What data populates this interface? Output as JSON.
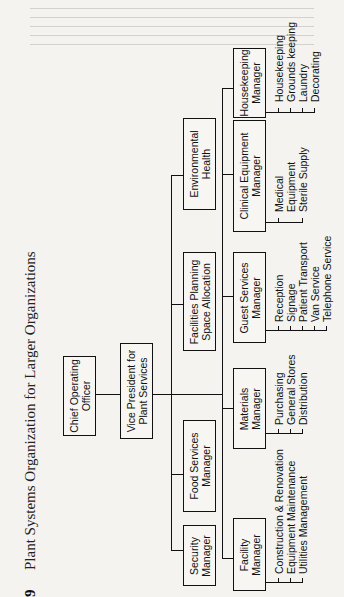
{
  "figure": {
    "number_fragment": "9",
    "title": "Plant Systems Organization for Larger Organizations"
  },
  "org_chart": {
    "root": {
      "label": "Chief Operating\nOfficer"
    },
    "vp": {
      "label": "Vice President for\nPlant Services"
    },
    "upper_row": [
      {
        "id": "security",
        "label": "Security\nManager"
      },
      {
        "id": "food",
        "label": "Food Services\nManager"
      },
      {
        "id": "facilities_planning",
        "label": "Facilities Planning\nSpace Allocation"
      },
      {
        "id": "environmental",
        "label": "Environmental\nHealth"
      }
    ],
    "lower_row": [
      {
        "id": "facility",
        "label": "Facility\nManager",
        "duties": [
          "Construction & Renovation",
          "Equipment Maintenance",
          "Utilities Management"
        ]
      },
      {
        "id": "materials",
        "label": "Materials\nManager",
        "duties": [
          "Purchasing",
          "General Stores",
          "Distribution"
        ]
      },
      {
        "id": "guest",
        "label": "Guest Services\nManager",
        "duties": [
          "Reception",
          "Signage",
          "Patient Transport",
          "Van Service",
          "Telephone Service"
        ]
      },
      {
        "id": "clinical",
        "label": "Clinical Equipment\nManager",
        "duties": [
          "Medical",
          "Equipment",
          "Sterile Supply"
        ]
      },
      {
        "id": "housekeeping",
        "label": "Housekeeping\nManager",
        "duties": [
          "Housekeeping",
          "Grounds keeping",
          "Laundry",
          "Decorating"
        ]
      }
    ]
  }
}
